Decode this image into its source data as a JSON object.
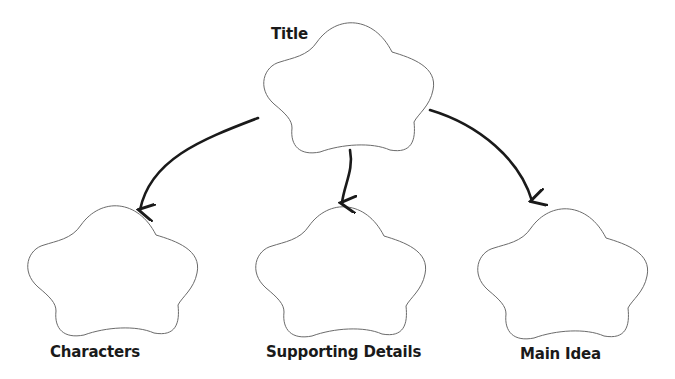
{
  "diagram": {
    "type": "graphic-organizer",
    "nodes": [
      {
        "id": "title",
        "label": "Title",
        "shape": "cloud"
      },
      {
        "id": "characters",
        "label": "Characters",
        "shape": "cloud"
      },
      {
        "id": "supporting",
        "label": "Supporting Details",
        "shape": "cloud"
      },
      {
        "id": "main_idea",
        "label": "Main Idea",
        "shape": "cloud"
      }
    ],
    "edges": [
      {
        "from": "title",
        "to": "characters"
      },
      {
        "from": "title",
        "to": "supporting"
      },
      {
        "from": "title",
        "to": "main_idea"
      }
    ],
    "colors": {
      "outline": "#6b6b6b",
      "arrow": "#1a1a1a",
      "text": "#1a1a1a",
      "background": "#ffffff"
    }
  }
}
